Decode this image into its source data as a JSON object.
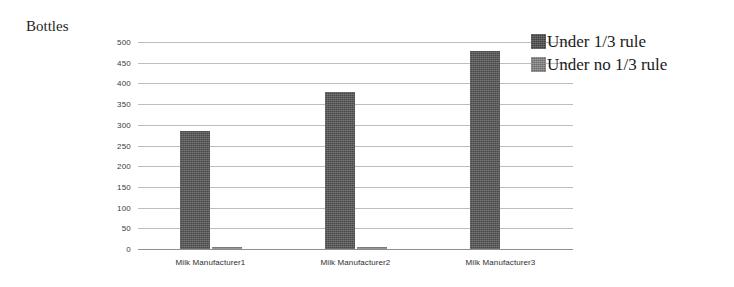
{
  "chart_data": {
    "type": "bar",
    "title": "Bottles",
    "xlabel": "",
    "ylabel": "Bottles",
    "ylim": [
      0,
      500
    ],
    "yticks": [
      0,
      50,
      100,
      150,
      200,
      250,
      300,
      350,
      400,
      450,
      500
    ],
    "ytick_labels": [
      "0",
      "50",
      "100",
      "150",
      "200",
      "250",
      "300",
      "350",
      "400",
      "450",
      "500"
    ],
    "grid": true,
    "legend_position": "right",
    "categories": [
      "Milk Manufacturer1",
      "Milk Manufacturer2",
      "Milk Manufacturer3"
    ],
    "series": [
      {
        "name": "Under 1/3 rule",
        "color": "#58585a",
        "values": [
          285,
          380,
          478
        ]
      },
      {
        "name": "Under no 1/3 rule",
        "color": "#8a8a8c",
        "values": [
          5,
          4,
          0
        ]
      }
    ]
  },
  "legend": {
    "items": [
      {
        "label": "Under 1/3 rule",
        "swatch": "legend-swatch-dark"
      },
      {
        "label": "Under no 1/3 rule",
        "swatch": "legend-swatch-light"
      }
    ]
  }
}
